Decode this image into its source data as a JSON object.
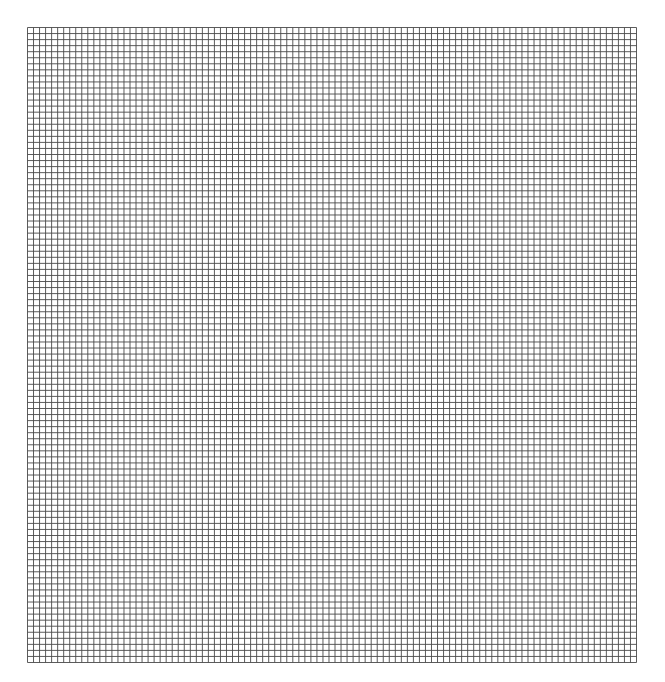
{
  "canvas": {
    "width": 665,
    "height": 682,
    "background": "#ffffff"
  },
  "grid": {
    "left": 27,
    "top": 27,
    "width": 609,
    "height": 635,
    "columns": 101,
    "rows": 105,
    "line_color": "#4a4a4a",
    "line_width": 0.9
  }
}
